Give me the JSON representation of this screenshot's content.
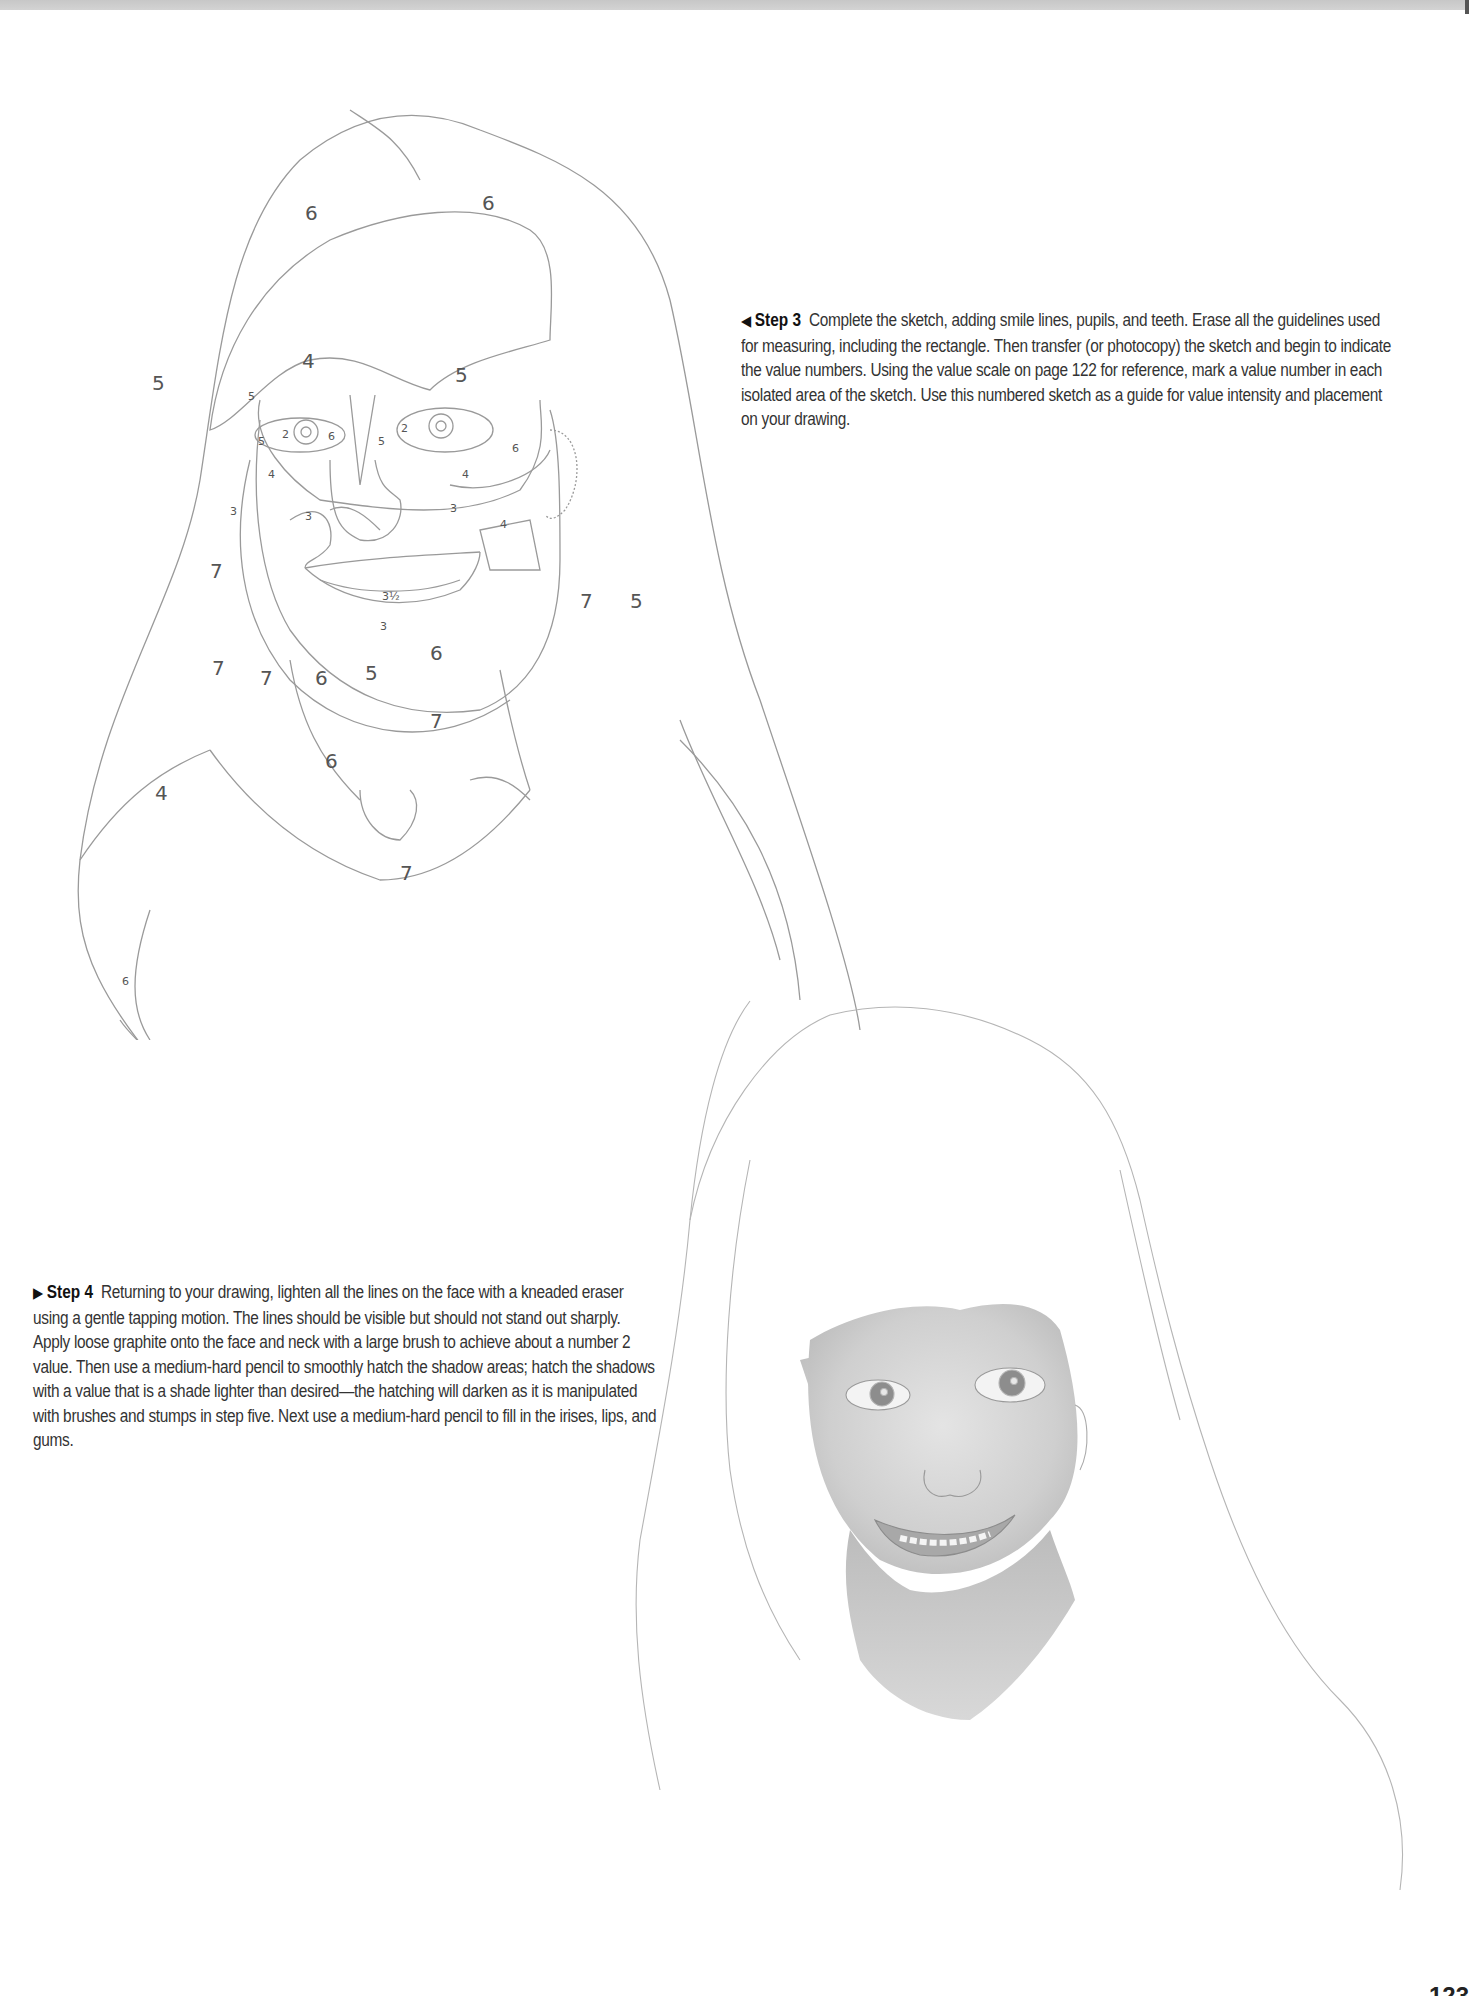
{
  "header_bar": {
    "color": "#cccccc"
  },
  "step3": {
    "arrow_icon": "◀",
    "label": "Step 3",
    "text": "Complete the sketch, adding smile lines, pupils, and teeth. Erase all the guidelines used for measuring, including the rectangle. Then transfer (or photocopy) the sketch and begin to indicate the value numbers. Using the value scale on page 122 for reference, mark a value number in each isolated area of the sketch. Use this numbered sketch as a guide for value intensity and placement on your drawing."
  },
  "step4": {
    "arrow_icon": "▶",
    "label": "Step 4",
    "text": "Returning to your drawing, lighten all the lines on the face with a kneaded eraser using a gentle tapping motion. The lines should be visible but should not stand out sharply. Apply loose graphite onto the face and neck with a large brush to achieve about a number 2 value. Then use a medium-hard pencil to smoothly hatch the shadow areas; hatch the shadows with a value that is a shade lighter than desired—the hatching will darken as it is manipulated with brushes and stumps in step five. Next use a medium-hard pencil to fill in the irises, lips, and gums."
  },
  "sketch_values": {
    "hair_top": "6",
    "hair_top_right": "6",
    "forehead": "4",
    "hair_left": "5",
    "hair_right": "5",
    "brow_left": "5",
    "eye_left_outer": "5",
    "eye_left_white": "2",
    "pupil_left": "10",
    "iris_left": "7",
    "eye_right_white": "2",
    "pupil_right": "10",
    "nose_side_left": "6",
    "nose_bridge": "5",
    "cheek_left": "4",
    "cheek_right": "4",
    "jaw_left": "3",
    "cheek_lower_left": "3",
    "cheek_lower_right": "3",
    "cheek_patch_right": "4",
    "nose_tip": "3",
    "nostril": "5",
    "upper_lip": "3.5",
    "lip": "6",
    "chin": "3½",
    "ear": "6",
    "jaw_under": "3",
    "hair_left_lower": "7",
    "hair_right_lower": "7",
    "hair_right_outer": "5",
    "neck_shadow_left": "7",
    "neck_left": "7",
    "neck_mid": "6",
    "neck_center": "5",
    "neck_right": "6",
    "collar_right": "7",
    "neck_bottom": "6",
    "chin_shadow": "6",
    "shoulder_left": "4",
    "shirt": "7",
    "hair_tip": "6"
  },
  "page_number": "123"
}
